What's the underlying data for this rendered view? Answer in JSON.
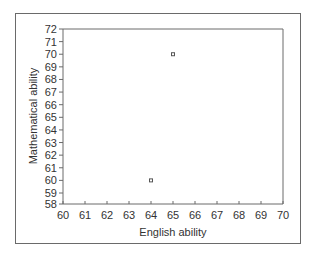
{
  "chart_data": {
    "type": "scatter",
    "title": "",
    "xlabel": "English ability",
    "ylabel": "Mathematical ability",
    "xlim": [
      60,
      70
    ],
    "ylim": [
      58,
      72
    ],
    "x_ticks": [
      "60",
      "61",
      "62",
      "63",
      "64",
      "65",
      "66",
      "67",
      "68",
      "69",
      "70"
    ],
    "y_ticks": [
      "72",
      "71",
      "70",
      "69",
      "68",
      "67",
      "66",
      "65",
      "64",
      "63",
      "62",
      "61",
      "60",
      "59",
      "58"
    ],
    "y_axis_break": "between 58 and 59 (58 drawn at origin, compressed spacing)",
    "grid": false,
    "legend": null,
    "points": [
      {
        "x": 64,
        "y": 60
      },
      {
        "x": 65,
        "y": 70
      }
    ],
    "marker": "hollow square",
    "colors": {
      "axis": "#6a6a6a",
      "marker": "#555555",
      "frame": "#6a6a6a"
    }
  }
}
